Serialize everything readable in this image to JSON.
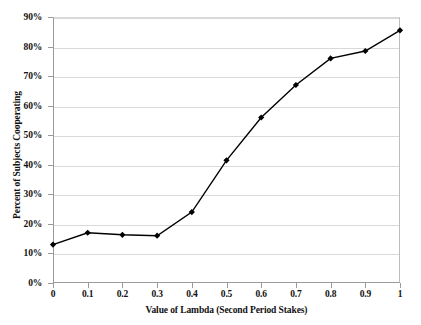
{
  "chart_data": {
    "type": "line",
    "title": "",
    "xlabel": "Value of Lambda (Second Period Stakes)",
    "ylabel": "Percent of Subjects Cooperating",
    "x": [
      0,
      0.1,
      0.2,
      0.3,
      0.4,
      0.5,
      0.6,
      0.7,
      0.8,
      0.9,
      1
    ],
    "values": [
      13,
      17,
      16.3,
      16,
      24,
      41.5,
      56,
      67,
      76,
      78.5,
      85.5
    ],
    "xlim": [
      0,
      1
    ],
    "ylim": [
      0,
      90
    ],
    "x_tick_labels": [
      "0",
      "0.1",
      "0.2",
      "0.3",
      "0.4",
      "0.5",
      "0.6",
      "0.7",
      "0.8",
      "0.9",
      "1"
    ],
    "y_tick_labels": [
      "0%",
      "10%",
      "20%",
      "30%",
      "40%",
      "50%",
      "60%",
      "70%",
      "80%",
      "90%"
    ],
    "y_tick_values": [
      0,
      10,
      20,
      30,
      40,
      50,
      60,
      70,
      80,
      90
    ],
    "grid": true,
    "legend": "none",
    "series_color": "#000000",
    "marker": "diamond",
    "gridline_color": "#d9d9d9",
    "axis_color": "#9a9a9a",
    "background_color": "#ffffff"
  }
}
